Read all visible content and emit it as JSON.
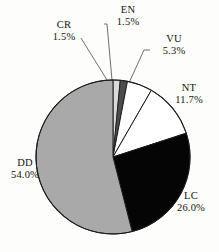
{
  "chart_data": {
    "type": "pie",
    "title": "",
    "subtitle": "",
    "xlabel": "",
    "ylabel": "",
    "legend_position": "none",
    "grid": false,
    "labels_show_percent": true,
    "start_angle_deg": 0,
    "direction": "clockwise",
    "categories": [
      "CR",
      "EN",
      "VU",
      "NT",
      "LC",
      "DD"
    ],
    "values": [
      1.5,
      1.5,
      5.3,
      11.7,
      26.0,
      54.0
    ],
    "slices": [
      {
        "label": "CR",
        "percent": "1.5%",
        "value": 1.5,
        "color": "#d9d9d9"
      },
      {
        "label": "EN",
        "percent": "1.5%",
        "value": 1.5,
        "color": "#4c4c4c"
      },
      {
        "label": "VU",
        "percent": "5.3%",
        "value": 5.3,
        "color": "#ffffff"
      },
      {
        "label": "NT",
        "percent": "11.7%",
        "value": 11.7,
        "color": "#ffffff"
      },
      {
        "label": "LC",
        "percent": "26.0%",
        "value": 26.0,
        "color": "#050505"
      },
      {
        "label": "DD",
        "percent": "54.0%",
        "value": 54.0,
        "color": "#a9a9a9"
      }
    ],
    "colors": {
      "CR": "#d9d9d9",
      "EN": "#4c4c4c",
      "VU": "#ffffff",
      "NT": "#ffffff",
      "LC": "#050505",
      "DD": "#a9a9a9",
      "outline": "#1a1a1a",
      "leader_line": "#4a4a4a",
      "background": "#fdfdfc",
      "text": "#15140f"
    }
  },
  "labels": {
    "cr": {
      "name": "CR",
      "percent": "1.5%"
    },
    "en": {
      "name": "EN",
      "percent": "1.5%"
    },
    "vu": {
      "name": "VU",
      "percent": "5.3%"
    },
    "nt": {
      "name": "NT",
      "percent": "11.7%"
    },
    "lc": {
      "name": "LC",
      "percent": "26.0%"
    },
    "dd": {
      "name": "DD",
      "percent": "54.0%"
    }
  }
}
